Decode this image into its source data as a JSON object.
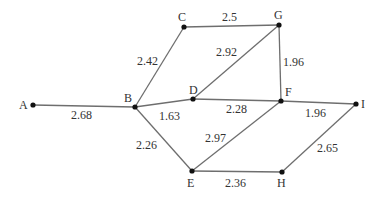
{
  "graph": {
    "nodes": [
      {
        "id": "A",
        "label": "A",
        "x": 33,
        "y": 105
      },
      {
        "id": "B",
        "label": "B",
        "x": 135,
        "y": 107
      },
      {
        "id": "C",
        "label": "C",
        "x": 184,
        "y": 27
      },
      {
        "id": "G",
        "label": "G",
        "x": 279,
        "y": 25
      },
      {
        "id": "D",
        "label": "D",
        "x": 193,
        "y": 99
      },
      {
        "id": "F",
        "label": "F",
        "x": 281,
        "y": 101
      },
      {
        "id": "I",
        "label": "I",
        "x": 356,
        "y": 104
      },
      {
        "id": "E",
        "label": "E",
        "x": 192,
        "y": 171
      },
      {
        "id": "H",
        "label": "H",
        "x": 282,
        "y": 172
      }
    ],
    "edges": [
      {
        "from": "A",
        "to": "B",
        "weight": "2.68"
      },
      {
        "from": "B",
        "to": "C",
        "weight": "2.42"
      },
      {
        "from": "C",
        "to": "G",
        "weight": "2.5"
      },
      {
        "from": "D",
        "to": "G",
        "weight": "2.92"
      },
      {
        "from": "G",
        "to": "F",
        "weight": "1.96"
      },
      {
        "from": "B",
        "to": "D",
        "weight": "1.63"
      },
      {
        "from": "D",
        "to": "F",
        "weight": "2.28"
      },
      {
        "from": "F",
        "to": "I",
        "weight": "1.96"
      },
      {
        "from": "B",
        "to": "E",
        "weight": "2.26"
      },
      {
        "from": "E",
        "to": "F",
        "weight": "2.97"
      },
      {
        "from": "E",
        "to": "H",
        "weight": "2.36"
      },
      {
        "from": "H",
        "to": "I",
        "weight": "2.65"
      }
    ]
  }
}
